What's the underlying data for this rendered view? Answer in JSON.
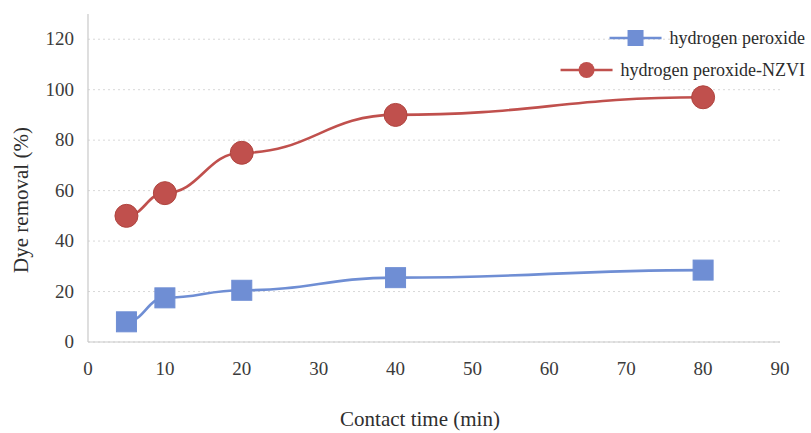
{
  "chart_data": {
    "type": "line",
    "title": "",
    "subtitle": "",
    "xlabel": "Contact time (min)",
    "ylabel": "Dye removal (%)",
    "x": [
      5,
      10,
      20,
      40,
      80
    ],
    "xlim": [
      0,
      90
    ],
    "ylim": [
      0,
      130
    ],
    "xticks": [
      0,
      10,
      20,
      30,
      40,
      50,
      60,
      70,
      80,
      90
    ],
    "yticks": [
      0,
      20,
      40,
      60,
      80,
      100,
      120
    ],
    "xtick_labels": [
      "0",
      "10",
      "20",
      "30",
      "40",
      "50",
      "60",
      "70",
      "80",
      "90"
    ],
    "ytick_labels": [
      "0",
      "20",
      "40",
      "60",
      "80",
      "100",
      "120"
    ],
    "grid": true,
    "grid_orientation": "both-light",
    "legend_position": "top-right",
    "series": [
      {
        "name": "hydrogen peroxide",
        "color": "#6f8ed4",
        "marker": "square",
        "values": [
          8,
          17.5,
          20.5,
          25.5,
          28.5
        ]
      },
      {
        "name": "hydrogen peroxide-NZVI",
        "color": "#c0504d",
        "marker": "circle",
        "values": [
          50,
          59,
          75,
          90,
          97
        ]
      }
    ]
  },
  "legend": {
    "items": [
      {
        "label": "hydrogen peroxide",
        "color": "#6f8ed4",
        "marker": "square"
      },
      {
        "label": "hydrogen peroxide-NZVI",
        "color": "#c0504d",
        "marker": "circle"
      }
    ]
  },
  "axes": {
    "x_title": "Contact time (min)",
    "y_title": "Dye removal (%)"
  },
  "colors": {
    "series_1": "#6f8ed4",
    "series_2": "#c0504d",
    "grid": "#d8d8d8",
    "axis": "#c9c9c9",
    "text": "#2e2e2e",
    "background": "#ffffff"
  }
}
